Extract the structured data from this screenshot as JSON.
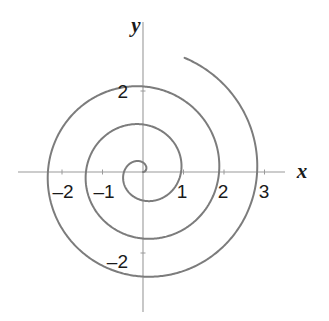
{
  "figure": {
    "background_color": "#ffffff",
    "width": 329,
    "height": 321
  },
  "chart_data": {
    "type": "line",
    "subtype": "polar-spiral",
    "title": "",
    "subtitle": "",
    "xlabel": "x",
    "ylabel": "y",
    "equation": "r = aθ (Archimedean spiral)",
    "grid": false,
    "legend": null,
    "legend_position": "none",
    "xlim": [
      -3.1,
      3.4
    ],
    "ylim": [
      -3.4,
      3.2
    ],
    "x_ticks": [
      -2,
      -1,
      1,
      2,
      3
    ],
    "x_tick_labels": [
      "–2",
      "–1",
      "1",
      "2",
      "3"
    ],
    "y_ticks": [
      2,
      -2
    ],
    "y_tick_labels": [
      "2",
      "–2"
    ],
    "series": [
      {
        "name": "spiral",
        "color": "#7c7c7c",
        "line_width": 2,
        "theta_start_deg": 0,
        "theta_end_deg": 1150,
        "r_start": 0,
        "r_end": 3.0,
        "turns": 3.2,
        "polar_points": [
          {
            "theta_deg": 0,
            "r": 0.0
          },
          {
            "theta_deg": 90,
            "r": 0.235
          },
          {
            "theta_deg": 180,
            "r": 0.47
          },
          {
            "theta_deg": 270,
            "r": 0.705
          },
          {
            "theta_deg": 360,
            "r": 0.94
          },
          {
            "theta_deg": 450,
            "r": 1.175
          },
          {
            "theta_deg": 540,
            "r": 1.41
          },
          {
            "theta_deg": 630,
            "r": 1.645
          },
          {
            "theta_deg": 720,
            "r": 1.88
          },
          {
            "theta_deg": 810,
            "r": 2.11
          },
          {
            "theta_deg": 900,
            "r": 2.35
          },
          {
            "theta_deg": 990,
            "r": 2.58
          },
          {
            "theta_deg": 1080,
            "r": 2.82
          },
          {
            "theta_deg": 1150,
            "r": 3.0
          }
        ]
      }
    ],
    "axes": {
      "color": "#9a9a9a",
      "line_width": 1,
      "x_axis_y_value": 0,
      "y_axis_x_value": 0,
      "tick_length_px": 5
    },
    "origin_px": {
      "x": 143,
      "y": 172
    },
    "scale_px_per_unit": 40.5
  },
  "labels": {
    "x_axis": "x",
    "y_axis": "y",
    "x_neg_2": "–2",
    "x_neg_1": "–1",
    "x_pos_1": "1",
    "x_pos_2": "2",
    "x_pos_3": "3",
    "y_pos_2": "2",
    "y_neg_2": "–2"
  },
  "colors": {
    "spiral": "#7c7c7c",
    "axis": "#9a9a9a",
    "text": "#1a1a1a",
    "background": "#ffffff"
  }
}
